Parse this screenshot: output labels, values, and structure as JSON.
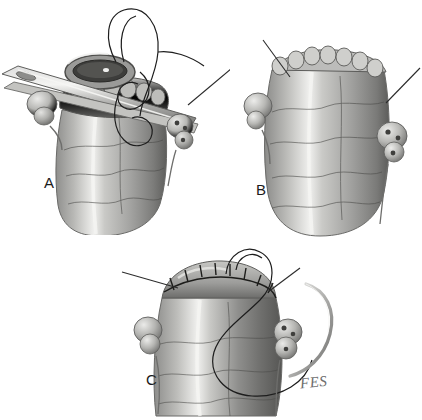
{
  "figure": {
    "title": "Three-stage surgical technique illustration of tubular organ closure",
    "background_color": "#ffffff",
    "width": 422,
    "height": 420,
    "artist_signature": "FES",
    "style": "grayscale pencil and wash medical illustration"
  },
  "palette": {
    "background": "#ffffff",
    "tissue_light": "#d8d8d6",
    "tissue_mid": "#a9a9a6",
    "tissue_dark": "#6f6f6d",
    "tissue_shadow": "#4a4a48",
    "highlight": "#f2f2f0",
    "vessel_line": "#4b4b49",
    "suture_line": "#1d1d1d",
    "metal_light": "#e6e6e4",
    "metal_mid": "#b4b4b2",
    "metal_dark": "#6a6a68",
    "leader_line": "#2b2b2b",
    "label_text": "#1b1b1b",
    "signature_text": "#6d6d6d"
  },
  "panels": [
    {
      "id": "A",
      "label": "A",
      "label_x": 44,
      "label_y": 182,
      "caption_semantics": "Transected tubular organ held by a curved surgical clamp across its open end; a suture on a needle passes through the everted rim with a long looping thread above. Lobulated glandular nodules sit on either side of the tube.",
      "elements": [
        "surgical-clamp",
        "open-lumen",
        "everted-rim",
        "suture-thread-loop",
        "left-nodule",
        "right-nodule",
        "leader-line"
      ]
    },
    {
      "id": "B",
      "label": "B",
      "label_x": 256,
      "label_y": 182,
      "caption_semantics": "The clamp has been removed, showing the scalloped, serially clamped cut edge of the open tubular organ with nodules preserved on each lateral surface. Two leader lines point to the cut edge.",
      "elements": [
        "scalloped-cut-edge",
        "left-nodule",
        "right-nodule",
        "leader-line-left",
        "leader-line-right"
      ]
    },
    {
      "id": "C",
      "label": "C",
      "label_x": 146,
      "label_y": 372,
      "caption_semantics": "The cut edge is closed with a running locked suture line; the needle and trailing suture loop hang to the right of the specimen. Nodules remain on both sides.",
      "elements": [
        "running-suture-line",
        "curved-needle",
        "suture-thread-loop",
        "left-nodule",
        "right-nodule",
        "leader-line-left",
        "leader-line-right"
      ]
    }
  ],
  "annotations": {
    "leader_lines": [
      {
        "panel": "A",
        "from_x": 232,
        "from_y": 68,
        "to_x": 188,
        "to_y": 105
      },
      {
        "panel": "B",
        "from_x": 263,
        "from_y": 40,
        "to_x": 290,
        "to_y": 77
      },
      {
        "panel": "B",
        "from_x": 420,
        "from_y": 68,
        "to_x": 386,
        "to_y": 103
      },
      {
        "panel": "C",
        "from_x": 122,
        "from_y": 272,
        "to_x": 178,
        "to_y": 288
      },
      {
        "panel": "C",
        "from_x": 300,
        "from_y": 268,
        "to_x": 268,
        "to_y": 292
      }
    ]
  }
}
